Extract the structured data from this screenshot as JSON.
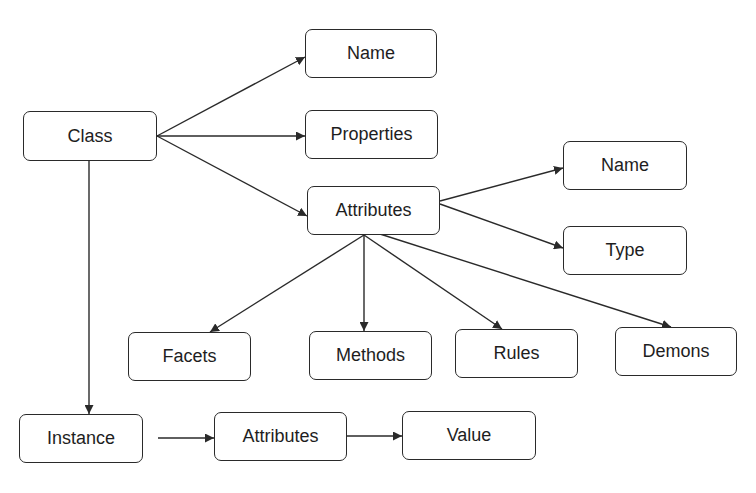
{
  "diagram": {
    "type": "class-hierarchy",
    "colors": {
      "stroke": "#2a2a2a",
      "text": "#1e1e1e",
      "background": "#ffffff"
    },
    "nodes": [
      {
        "id": "class",
        "label": "Class",
        "x": 23,
        "y": 111,
        "w": 134,
        "h": 50
      },
      {
        "id": "class-name",
        "label": "Name",
        "x": 305,
        "y": 29,
        "w": 132,
        "h": 49
      },
      {
        "id": "class-properties",
        "label": "Properties",
        "x": 305,
        "y": 110,
        "w": 133,
        "h": 49
      },
      {
        "id": "class-attributes",
        "label": "Attributes",
        "x": 307,
        "y": 186,
        "w": 133,
        "h": 49
      },
      {
        "id": "attr-name",
        "label": "Name",
        "x": 563,
        "y": 141,
        "w": 124,
        "h": 49
      },
      {
        "id": "attr-type",
        "label": "Type",
        "x": 563,
        "y": 226,
        "w": 124,
        "h": 49
      },
      {
        "id": "facets",
        "label": "Facets",
        "x": 128,
        "y": 332,
        "w": 123,
        "h": 49
      },
      {
        "id": "methods",
        "label": "Methods",
        "x": 309,
        "y": 331,
        "w": 123,
        "h": 49
      },
      {
        "id": "rules",
        "label": "Rules",
        "x": 455,
        "y": 329,
        "w": 123,
        "h": 49
      },
      {
        "id": "demons",
        "label": "Demons",
        "x": 615,
        "y": 327,
        "w": 122,
        "h": 49
      },
      {
        "id": "instance",
        "label": "Instance",
        "x": 19,
        "y": 414,
        "w": 124,
        "h": 49
      },
      {
        "id": "instance-attributes",
        "label": "Attributes",
        "x": 214,
        "y": 412,
        "w": 133,
        "h": 49
      },
      {
        "id": "value",
        "label": "Value",
        "x": 402,
        "y": 411,
        "w": 134,
        "h": 49
      }
    ],
    "edges": [
      {
        "from": "class",
        "to": "class-name",
        "x1": 157,
        "y1": 136,
        "x2": 305,
        "y2": 57
      },
      {
        "from": "class",
        "to": "class-properties",
        "x1": 157,
        "y1": 136,
        "x2": 305,
        "y2": 136
      },
      {
        "from": "class",
        "to": "class-attributes",
        "x1": 157,
        "y1": 136,
        "x2": 307,
        "y2": 216
      },
      {
        "from": "class",
        "to": "instance",
        "x1": 89,
        "y1": 161,
        "x2": 89,
        "y2": 414
      },
      {
        "from": "class-attributes",
        "to": "attr-name",
        "x1": 440,
        "y1": 201,
        "x2": 563,
        "y2": 168
      },
      {
        "from": "class-attributes",
        "to": "attr-type",
        "x1": 440,
        "y1": 204,
        "x2": 563,
        "y2": 248
      },
      {
        "from": "class-attributes",
        "to": "facets",
        "x1": 364,
        "y1": 235,
        "x2": 210,
        "y2": 332
      },
      {
        "from": "class-attributes",
        "to": "methods",
        "x1": 364,
        "y1": 235,
        "x2": 364,
        "y2": 331
      },
      {
        "from": "class-attributes",
        "to": "rules",
        "x1": 364,
        "y1": 235,
        "x2": 502,
        "y2": 329
      },
      {
        "from": "class-attributes",
        "to": "demons",
        "x1": 380,
        "y1": 234,
        "x2": 671,
        "y2": 327
      },
      {
        "from": "instance",
        "to": "instance-attributes",
        "x1": 158,
        "y1": 438,
        "x2": 214,
        "y2": 438
      },
      {
        "from": "instance-attributes",
        "to": "value",
        "x1": 347,
        "y1": 436,
        "x2": 402,
        "y2": 436
      }
    ]
  }
}
